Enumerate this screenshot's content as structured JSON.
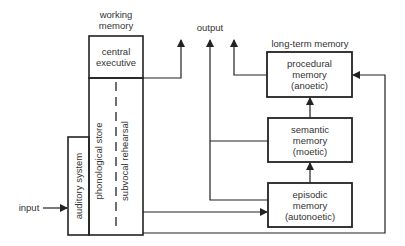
{
  "labels": {
    "working_memory": "working\nmemory",
    "working_memory_line1": "working",
    "working_memory_line2": "memory",
    "central_executive_line1": "central",
    "central_executive_line2": "executive",
    "phonological_store": "phonological store",
    "subvocal_rehearsal": "subvocal rehearsal",
    "auditory_system": "auditory system",
    "input": "input",
    "output": "output",
    "long_term_memory": "long-term memory",
    "procedural": [
      "procedural",
      "memory",
      "(anoetic)"
    ],
    "semantic": [
      "semantic",
      "memory",
      "(moetic)"
    ],
    "episodic": [
      "episodic",
      "memory",
      "(autonoetic)"
    ]
  },
  "colors": {
    "line": "#222222",
    "background": "#ffffff"
  }
}
